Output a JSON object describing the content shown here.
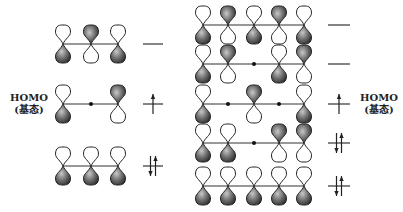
{
  "labels": {
    "left_homo": "HOMO",
    "left_ground": "(基态)",
    "right_homo": "HOMO",
    "right_ground": "(基态)"
  },
  "colors": {
    "shaded_lobe": "#5a5a5a",
    "white_lobe": "#ffffff",
    "outline": "#222222",
    "bond": "#333333"
  },
  "left_system": {
    "name": "allyl",
    "atom_x": [
      63,
      91,
      118
    ],
    "level_x": [
      143,
      163
    ],
    "orbitals": [
      {
        "y": 44,
        "phases": [
          "+",
          "-",
          "+"
        ],
        "electrons": 0
      },
      {
        "y": 104,
        "phases": [
          "+",
          "0",
          "-"
        ],
        "electrons": 1,
        "homo": true
      },
      {
        "y": 166,
        "phases": [
          "+",
          "+",
          "+"
        ],
        "electrons": 2
      }
    ]
  },
  "right_system": {
    "name": "pentadienyl",
    "atom_x": [
      203,
      228,
      254,
      279,
      304
    ],
    "level_x": [
      328,
      350
    ],
    "orbitals": [
      {
        "y": 25,
        "phases": [
          "+",
          "-",
          "+",
          "-",
          "+"
        ],
        "electrons": 0
      },
      {
        "y": 64,
        "phases": [
          "+",
          "-",
          "0",
          "+",
          "-"
        ],
        "electrons": 0
      },
      {
        "y": 104,
        "phases": [
          "+",
          "0",
          "-",
          "0",
          "+"
        ],
        "electrons": 1,
        "homo": true
      },
      {
        "y": 143,
        "phases": [
          "+",
          "+",
          "0",
          "-",
          "-"
        ],
        "electrons": 2
      },
      {
        "y": 186,
        "phases": [
          "+",
          "+",
          "+",
          "+",
          "+"
        ],
        "electrons": 2
      }
    ]
  }
}
